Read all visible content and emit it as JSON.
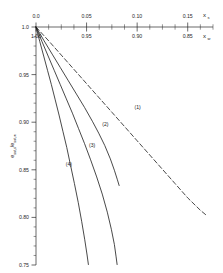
{
  "chart_data": {
    "type": "line",
    "title": "",
    "subtitle": "",
    "xlabel": "x_s",
    "xlabel_secondary": "x_w",
    "ylabel": "e_sat,s / e_sat,w",
    "grid": false,
    "legend": "inline-curve-labels",
    "axes": {
      "x_top": {
        "name": "x",
        "subscript": "s",
        "ticks": [
          0.0,
          0.05,
          0.1,
          0.15
        ],
        "ticklabels": [
          "0.0",
          "0.05",
          "0.10",
          "0.15"
        ],
        "minor_ticks_per_interval": 4,
        "range": [
          0.0,
          0.175
        ],
        "position": "top"
      },
      "x_bottom_of_top": {
        "name": "x",
        "subscript": "w",
        "ticks": [
          1.0,
          0.95,
          0.9,
          0.85
        ],
        "ticklabels": [
          "1.00",
          "0.95",
          "0.90",
          "0.85"
        ],
        "minor_ticks_per_interval": 4,
        "range": [
          1.0,
          0.825
        ],
        "position": "top-secondary"
      },
      "y": {
        "name": "e",
        "subscript_num": "sat,s",
        "subscript_den": "sat,w",
        "ticks": [
          1.0,
          0.95,
          0.9,
          0.85,
          0.8,
          0.75
        ],
        "ticklabels": [
          "1.0",
          "0.95",
          "0.90",
          "0.85",
          "0.80",
          "0.75"
        ],
        "minor_ticks_per_interval": 5,
        "range": [
          0.75,
          1.0
        ],
        "position": "left",
        "inverted": true
      }
    },
    "series": [
      {
        "name": "(1)",
        "label": "(1)",
        "style": "dashed",
        "color": "#1a1a1a",
        "label_x": 0.0975,
        "label_y": 0.9135,
        "points": [
          [
            0.0,
            1.0
          ],
          [
            0.0125,
            0.9855
          ],
          [
            0.025,
            0.9705
          ],
          [
            0.0375,
            0.9555
          ],
          [
            0.05,
            0.9405
          ],
          [
            0.0625,
            0.9255
          ],
          [
            0.075,
            0.9105
          ],
          [
            0.0875,
            0.8955
          ],
          [
            0.1,
            0.8805
          ],
          [
            0.1125,
            0.8655
          ],
          [
            0.125,
            0.8505
          ],
          [
            0.1375,
            0.8355
          ],
          [
            0.15,
            0.8205
          ],
          [
            0.1625,
            0.8075
          ],
          [
            0.1685,
            0.8022
          ]
        ]
      },
      {
        "name": "(2)",
        "label": "(2)",
        "style": "solid",
        "color": "#1a1a1a",
        "label_x": 0.0655,
        "label_y": 0.8955,
        "points": [
          [
            0.0,
            1.0
          ],
          [
            0.008,
            0.9855
          ],
          [
            0.016,
            0.9715
          ],
          [
            0.024,
            0.9575
          ],
          [
            0.032,
            0.9435
          ],
          [
            0.04,
            0.9295
          ],
          [
            0.048,
            0.9155
          ],
          [
            0.056,
            0.9005
          ],
          [
            0.062,
            0.8885
          ],
          [
            0.068,
            0.8755
          ],
          [
            0.0735,
            0.8615
          ],
          [
            0.0775,
            0.8495
          ],
          [
            0.0805,
            0.8395
          ],
          [
            0.0822,
            0.8335
          ]
        ]
      },
      {
        "name": "(3)",
        "label": "(3)",
        "style": "solid",
        "color": "#1a1a1a",
        "label_x": 0.0525,
        "label_y": 0.8735,
        "points": [
          [
            0.0,
            1.0
          ],
          [
            0.006,
            0.9845
          ],
          [
            0.012,
            0.9695
          ],
          [
            0.018,
            0.9545
          ],
          [
            0.024,
            0.9395
          ],
          [
            0.03,
            0.9245
          ],
          [
            0.036,
            0.9095
          ],
          [
            0.042,
            0.8935
          ],
          [
            0.048,
            0.8775
          ],
          [
            0.054,
            0.8605
          ],
          [
            0.06,
            0.8425
          ],
          [
            0.0655,
            0.8245
          ],
          [
            0.0705,
            0.8055
          ],
          [
            0.0745,
            0.7875
          ],
          [
            0.0775,
            0.7715
          ],
          [
            0.0792,
            0.7585
          ],
          [
            0.0802,
            0.7505
          ]
        ]
      },
      {
        "name": "(4)",
        "label": "(4)",
        "style": "solid",
        "color": "#1a1a1a",
        "label_x": 0.0295,
        "label_y": 0.8545,
        "points": [
          [
            0.0,
            1.0
          ],
          [
            0.0038,
            0.9845
          ],
          [
            0.0076,
            0.9695
          ],
          [
            0.0114,
            0.9545
          ],
          [
            0.0152,
            0.9395
          ],
          [
            0.019,
            0.9235
          ],
          [
            0.0228,
            0.9075
          ],
          [
            0.0266,
            0.8905
          ],
          [
            0.0304,
            0.8735
          ],
          [
            0.0342,
            0.8545
          ],
          [
            0.038,
            0.8355
          ],
          [
            0.0418,
            0.8155
          ],
          [
            0.0452,
            0.7955
          ],
          [
            0.0482,
            0.7765
          ],
          [
            0.0505,
            0.7605
          ],
          [
            0.0518,
            0.7505
          ]
        ]
      }
    ]
  },
  "figure": {
    "axis_color": "#2a2a2a",
    "curve_color": "#1a1a1a",
    "background": "#ffffff"
  }
}
